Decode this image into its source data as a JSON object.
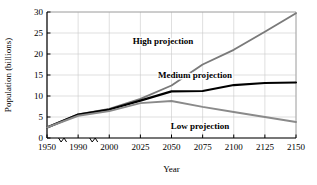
{
  "chart_data": {
    "type": "line",
    "title": "",
    "xlabel": "Year",
    "ylabel": "Population (billions)",
    "xlim": [
      1950,
      2150
    ],
    "ylim": [
      0,
      30
    ],
    "grid": true,
    "legend_position": "inline-annotations",
    "axis_break": true,
    "axis_break_note": "x-axis has break marks between 1950-1990 and 1990-2000 (non-linear spacing)",
    "xticks": [
      "1950",
      "1990",
      "2000",
      "2025",
      "2050",
      "2075",
      "2100",
      "2125",
      "2150"
    ],
    "yticks": [
      "0",
      "5",
      "10",
      "15",
      "20",
      "25",
      "30"
    ],
    "x": [
      1950,
      1990,
      2000,
      2025,
      2050,
      2075,
      2100,
      2125,
      2150
    ],
    "series": [
      {
        "name": "High projection",
        "color": "#7a7a7a",
        "values": [
          2.5,
          5.6,
          6.9,
          9.3,
          12.5,
          17.5,
          21.0,
          25.3,
          29.7
        ]
      },
      {
        "name": "Medium projection",
        "color": "#000000",
        "values": [
          2.5,
          5.6,
          6.8,
          8.9,
          11.1,
          11.2,
          12.6,
          13.1,
          13.2
        ]
      },
      {
        "name": "Low projection",
        "color": "#8a8a8a",
        "values": [
          2.5,
          5.3,
          6.4,
          8.3,
          8.8,
          7.4,
          6.2,
          5.0,
          3.8
        ]
      }
    ],
    "annotations": [
      {
        "text": "High projection",
        "x_px": 163,
        "y_px": 44
      },
      {
        "text": "Medium projection",
        "x_px": 195,
        "y_px": 78
      },
      {
        "text": "Low projection",
        "x_px": 200,
        "y_px": 129
      }
    ]
  }
}
